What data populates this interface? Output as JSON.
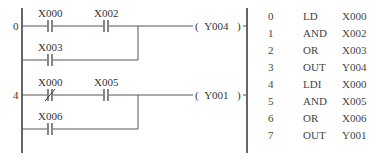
{
  "ladder": {
    "rungs": [
      {
        "step": "0",
        "series_contacts": [
          {
            "name": "X000",
            "type": "NO"
          },
          {
            "name": "X002",
            "type": "NO"
          }
        ],
        "parallel_contact": {
          "name": "X003",
          "type": "NO"
        },
        "coil": "Y004"
      },
      {
        "step": "4",
        "series_contacts": [
          {
            "name": "X000",
            "type": "NC"
          },
          {
            "name": "X005",
            "type": "NO"
          }
        ],
        "parallel_contact": {
          "name": "X006",
          "type": "NO"
        },
        "coil": "Y001"
      }
    ],
    "coil_open": "(",
    "coil_close": ")"
  },
  "instruction_list": [
    {
      "step": "0",
      "op": "LD",
      "arg": "X000"
    },
    {
      "step": "1",
      "op": "AND",
      "arg": "X002"
    },
    {
      "step": "2",
      "op": "OR",
      "arg": "X003"
    },
    {
      "step": "3",
      "op": "OUT",
      "arg": "Y004"
    },
    {
      "step": "4",
      "op": "LDI",
      "arg": "X000"
    },
    {
      "step": "5",
      "op": "AND",
      "arg": "X005"
    },
    {
      "step": "6",
      "op": "OR",
      "arg": "X006"
    },
    {
      "step": "7",
      "op": "OUT",
      "arg": "Y001"
    }
  ],
  "colors": {
    "line": "#444444",
    "text": "#333333",
    "background": "#ffffff"
  }
}
